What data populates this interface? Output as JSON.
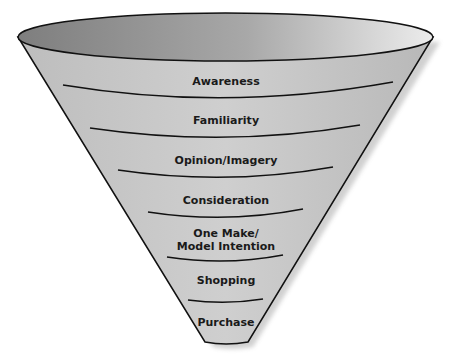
{
  "diagram": {
    "type": "funnel",
    "stages": [
      {
        "label": "Awareness"
      },
      {
        "label": "Familiarity"
      },
      {
        "label": "Opinion/Imagery"
      },
      {
        "label": "Consideration"
      },
      {
        "label_line1": "One Make/",
        "label_line2": "Model Intention"
      },
      {
        "label": "Shopping"
      },
      {
        "label": "Purchase"
      }
    ],
    "colors": {
      "rim_dark": "#8a8a8a",
      "rim_light": "#e6e6e6",
      "band": "#c4c4c4",
      "outline": "#111111"
    }
  }
}
